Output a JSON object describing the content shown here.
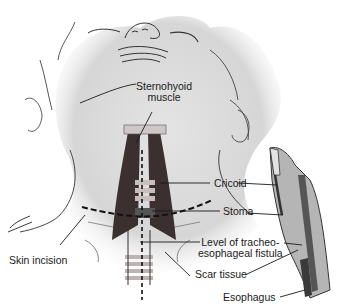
{
  "figure": {
    "type": "medical-illustration",
    "signature": "Tagede"
  },
  "labels": {
    "sternohyoid": {
      "line1": "Sternohyoid",
      "line2": "muscle"
    },
    "cricoid": "Cricoid",
    "stoma": "Stoma",
    "fistula": {
      "line1": "Level of tracheo-",
      "line2": "esophageal fistula"
    },
    "skin_incision": "Skin incision",
    "scar_tissue": "Scar tissue",
    "esophagus": "Esophagus"
  },
  "colors": {
    "skin_shade": "#d9d9d9",
    "muscle": "#3a3030",
    "trachea_ring": "#bfb3b3",
    "line": "#1a1a1a"
  }
}
